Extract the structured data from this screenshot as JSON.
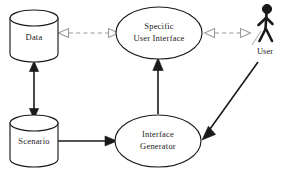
{
  "diagram": {
    "type": "uml-deployment-diagram",
    "canvas": {
      "width": 286,
      "height": 173,
      "background": "#ffffff"
    },
    "colors": {
      "stroke": "#1a1a1a",
      "dashed_stroke": "#9a9a9a",
      "fill": "#ffffff",
      "actor": "#1a1a1a"
    },
    "nodes": [
      {
        "id": "data",
        "shape": "cylinder",
        "label": "Data",
        "lines": [
          "Data"
        ],
        "cx": 34,
        "cy": 36,
        "rx": 24,
        "ry": 25
      },
      {
        "id": "specific-user-interface",
        "shape": "ellipse",
        "label": "Specific User Interface",
        "lines": [
          "Specific",
          "User Interface"
        ],
        "cx": 159,
        "cy": 33,
        "rx": 43,
        "ry": 26
      },
      {
        "id": "scenario",
        "shape": "cylinder",
        "label": "Scenario",
        "lines": [
          "Scenario"
        ],
        "cx": 34,
        "cy": 141,
        "rx": 24,
        "ry": 25
      },
      {
        "id": "interface-generator",
        "shape": "ellipse",
        "label": "Interface Generator",
        "lines": [
          "Interface",
          "Generator"
        ],
        "cx": 158,
        "cy": 141,
        "rx": 43,
        "ry": 26
      },
      {
        "id": "user",
        "shape": "actor",
        "label": "User",
        "lines": [
          "User"
        ],
        "cx": 265,
        "cy": 27
      }
    ],
    "edges": [
      {
        "id": "data-sui",
        "from": "data",
        "to": "specific-user-interface",
        "style": "dashed",
        "direction": "bidirectional",
        "arrowhead": "open-triangle",
        "color": "#9a9a9a"
      },
      {
        "id": "sui-user",
        "from": "specific-user-interface",
        "to": "user",
        "style": "dashed",
        "direction": "bidirectional",
        "arrowhead": "open-triangle",
        "color": "#9a9a9a"
      },
      {
        "id": "data-scenario",
        "from": "data",
        "to": "scenario",
        "style": "solid",
        "direction": "bidirectional",
        "arrowhead": "filled-triangle",
        "color": "#1a1a1a"
      },
      {
        "id": "generator-sui",
        "from": "interface-generator",
        "to": "specific-user-interface",
        "style": "solid",
        "direction": "forward",
        "arrowhead": "filled-triangle",
        "color": "#1a1a1a"
      },
      {
        "id": "scenario-generator",
        "from": "scenario",
        "to": "interface-generator",
        "style": "solid",
        "direction": "forward",
        "arrowhead": "filled-triangle",
        "color": "#1a1a1a"
      },
      {
        "id": "user-generator",
        "from": "user",
        "to": "interface-generator",
        "style": "solid",
        "direction": "forward",
        "arrowhead": "filled-triangle",
        "color": "#1a1a1a"
      }
    ]
  }
}
